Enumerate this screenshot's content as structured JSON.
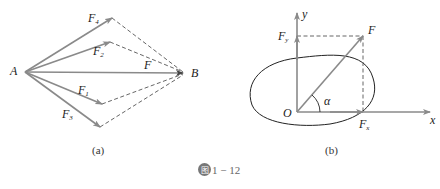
{
  "figure": {
    "caption_icon": "图",
    "caption_number": "1 − 12",
    "colors": {
      "arrow": "#8a8a8a",
      "dashed": "#555555",
      "outline": "#222222",
      "badge": "#777777"
    }
  },
  "panel_a": {
    "label": "(a)",
    "points": {
      "A": "A",
      "B": "B"
    },
    "forces": {
      "F4": "F",
      "F4_sub": "4",
      "F2": "F",
      "F2_sub": "2",
      "F": "F",
      "F1": "F",
      "F1_sub": "1",
      "F3": "F",
      "F3_sub": "3"
    }
  },
  "panel_b": {
    "label": "(b)",
    "axes": {
      "x": "x",
      "y": "y",
      "origin": "O"
    },
    "forces": {
      "F": "F",
      "Fx": "F",
      "Fx_sub": "x",
      "Fy": "F",
      "Fy_sub": "y"
    },
    "angle": "α"
  }
}
